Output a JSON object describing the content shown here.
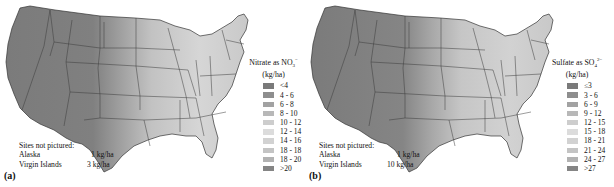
{
  "panels": [
    {
      "id": "a",
      "label": "(a)",
      "legend": {
        "title": "Nitrate as NO",
        "title_sub": "3",
        "title_sup": "−",
        "unit": "(kg/ha)",
        "items": [
          {
            "label": "<4",
            "color": "#7a7a7a"
          },
          {
            "label": "4 - 6",
            "color": "#8e8e8e"
          },
          {
            "label": "6 - 8",
            "color": "#a2a2a2"
          },
          {
            "label": "8 - 10",
            "color": "#b8b8b8"
          },
          {
            "label": "10 - 12",
            "color": "#cdcdcd"
          },
          {
            "label": "12 - 14",
            "color": "#dcdcdc"
          },
          {
            "label": "14 - 16",
            "color": "#d2d2d2"
          },
          {
            "label": "18 - 18",
            "color": "#c4c4c4"
          },
          {
            "label": "18 - 20",
            "color": "#b2b2b2"
          },
          {
            "label": ">20",
            "color": "#858585"
          }
        ]
      },
      "sites_not_pictured": {
        "heading": "Sites not pictured:",
        "rows": [
          {
            "name": "Alaska",
            "value": "1 kg/ha"
          },
          {
            "name": "Virgin Islands",
            "value": "3 kg/ha"
          }
        ]
      }
    },
    {
      "id": "b",
      "label": "(b)",
      "legend": {
        "title": "Sulfate as SO",
        "title_sub": "4",
        "title_sup": "2−",
        "unit": "(kg/ha)",
        "items": [
          {
            "label": "≤3",
            "color": "#7a7a7a"
          },
          {
            "label": "3 - 6",
            "color": "#8e8e8e"
          },
          {
            "label": "6 - 9",
            "color": "#a2a2a2"
          },
          {
            "label": "9 - 12",
            "color": "#b8b8b8"
          },
          {
            "label": "12 - 15",
            "color": "#cdcdcd"
          },
          {
            "label": "15 - 18",
            "color": "#dcdcdc"
          },
          {
            "label": "18 - 21",
            "color": "#d2d2d2"
          },
          {
            "label": "21 - 24",
            "color": "#c4c4c4"
          },
          {
            "label": "24 - 27",
            "color": "#b2b2b2"
          },
          {
            "label": ">27",
            "color": "#858585"
          }
        ]
      },
      "sites_not_pictured": {
        "heading": "Sites not pictured:",
        "rows": [
          {
            "name": "Alaska",
            "value": "1 kg/ha"
          },
          {
            "name": "Virgin Islands",
            "value": "10 kg/ha"
          }
        ]
      }
    }
  ],
  "colors": {
    "west": "#7d7d7d",
    "plains": "#9a9a9a",
    "midwest": "#bdbdbd",
    "east": "#d6d6d6",
    "border": "#333333"
  }
}
